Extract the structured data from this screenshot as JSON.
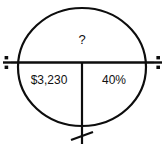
{
  "diagram": {
    "kind": "percent-proportion-circle",
    "stroke_color": "#0d0d0d",
    "text_color": "#111111",
    "background_color": "#ffffff",
    "top_label": "?",
    "bottom_left_label": "$3,230",
    "bottom_right_label": "40%",
    "left_operator_icon": "division-icon",
    "right_operator_icon": "division-icon",
    "bottom_operator_icon": "multiplication-slash-icon",
    "circle": {
      "center_x": 82,
      "center_y": 67,
      "radius_x": 65,
      "radius_y": 60
    },
    "horizontal_bar": {
      "y": 62,
      "x_start": 5,
      "x_end": 160
    },
    "vertical_divider": {
      "x": 82,
      "y_start": 62,
      "y_end": 145
    }
  }
}
